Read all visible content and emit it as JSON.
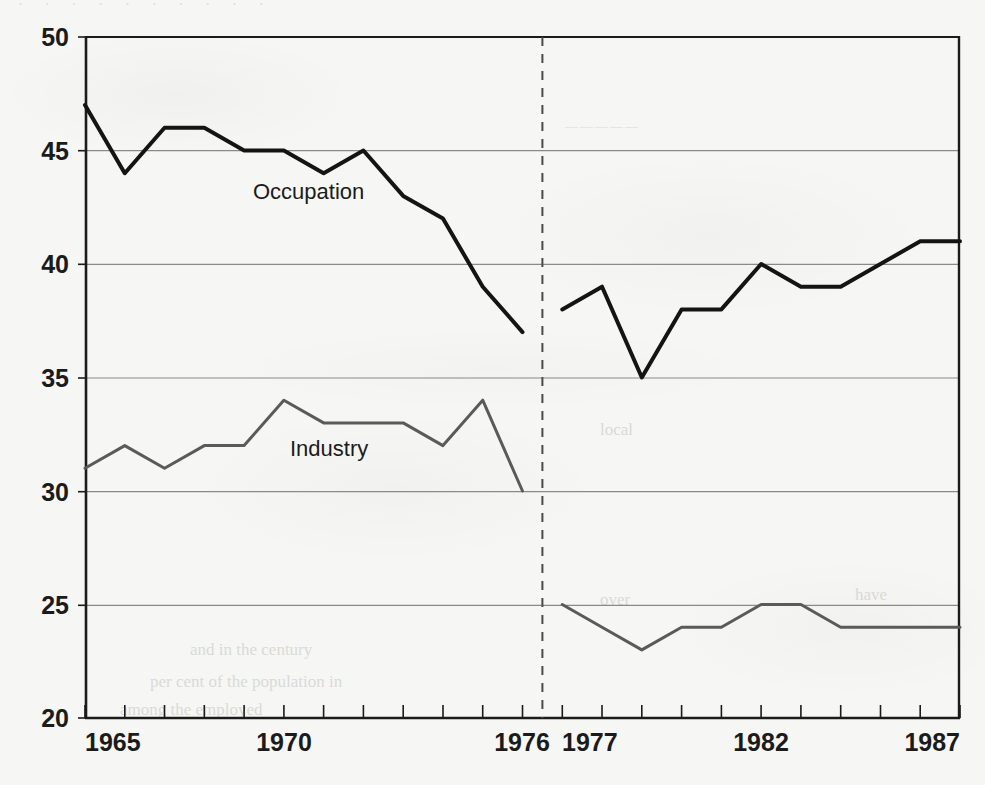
{
  "chart_data": {
    "type": "line",
    "title": "",
    "subtitle": "",
    "xlabel": "",
    "ylabel": "",
    "xlim": [
      1965,
      1987
    ],
    "ylim": [
      20,
      50
    ],
    "yticks": [
      20,
      25,
      30,
      35,
      40,
      45,
      50
    ],
    "ytick_labels": [
      "20",
      "25",
      "30",
      "35",
      "40",
      "45",
      "50"
    ],
    "xticks": [
      1965,
      1966,
      1967,
      1968,
      1969,
      1970,
      1971,
      1972,
      1973,
      1974,
      1975,
      1976,
      1977,
      1978,
      1979,
      1980,
      1981,
      1982,
      1983,
      1984,
      1985,
      1986,
      1987
    ],
    "xtick_labels_shown": [
      "1965",
      "1970",
      "1976",
      "1977",
      "1982",
      "1987"
    ],
    "grid": "horizontal",
    "legend_position": "inline-annotation",
    "series_break": {
      "label": "",
      "between": [
        1976,
        1977
      ],
      "style": "dashed-vertical"
    },
    "series": [
      {
        "name": "Occupation",
        "color": "#141414",
        "line_width": 4,
        "annotation": "Occupation",
        "segments": [
          {
            "x": [
              1965,
              1966,
              1967,
              1968,
              1969,
              1970,
              1971,
              1972,
              1973,
              1974,
              1975,
              1976
            ],
            "values": [
              47,
              44,
              46,
              46,
              45,
              45,
              44,
              45,
              43,
              42,
              39,
              37
            ]
          },
          {
            "x": [
              1977,
              1978,
              1979,
              1980,
              1981,
              1982,
              1983,
              1984,
              1985,
              1986,
              1987
            ],
            "values": [
              38,
              39,
              35,
              38,
              38,
              40,
              39,
              39,
              40,
              41,
              41
            ]
          }
        ]
      },
      {
        "name": "Industry",
        "color": "#5a5a5a",
        "line_width": 3,
        "annotation": "Industry",
        "segments": [
          {
            "x": [
              1965,
              1966,
              1967,
              1968,
              1969,
              1970,
              1971,
              1972,
              1973,
              1974,
              1975,
              1976
            ],
            "values": [
              31,
              32,
              31,
              32,
              32,
              34,
              33,
              33,
              33,
              32,
              34,
              30
            ]
          },
          {
            "x": [
              1977,
              1978,
              1979,
              1980,
              1981,
              1982,
              1983,
              1984,
              1985,
              1986,
              1987
            ],
            "values": [
              25,
              24,
              23,
              24,
              24,
              25,
              25,
              24,
              24,
              24,
              24
            ]
          }
        ]
      }
    ]
  },
  "axes": {
    "y_tick_20": "20",
    "y_tick_25": "25",
    "y_tick_30": "30",
    "y_tick_35": "35",
    "y_tick_40": "40",
    "y_tick_45": "45",
    "y_tick_50": "50",
    "x_tick_1965": "1965",
    "x_tick_1970": "1970",
    "x_tick_1976": "1976",
    "x_tick_1977": "1977",
    "x_tick_1982": "1982",
    "x_tick_1987": "1987"
  },
  "annotations": {
    "occupation": "Occupation",
    "industry": "Industry"
  },
  "colors": {
    "occupation_line": "#141414",
    "industry_line": "#5a5a5a",
    "gridline": "#8a8a8a",
    "axis": "#1b1b1b",
    "background": "#f6f6f4"
  }
}
